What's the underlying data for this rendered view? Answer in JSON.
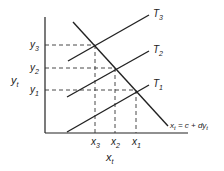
{
  "diagram": {
    "axes": {
      "y_label": "y",
      "y_label_sub": "t",
      "x_label": "x",
      "x_label_sub": "t"
    },
    "y_ticks": [
      {
        "label": "y",
        "sub": "3"
      },
      {
        "label": "y",
        "sub": "2"
      },
      {
        "label": "y",
        "sub": "1"
      }
    ],
    "x_ticks": [
      {
        "label": "x",
        "sub": "3"
      },
      {
        "label": "x",
        "sub": "2"
      },
      {
        "label": "x",
        "sub": "1"
      }
    ],
    "lines": [
      {
        "label": "T",
        "sub": "3"
      },
      {
        "label": "T",
        "sub": "2"
      },
      {
        "label": "T",
        "sub": "1"
      }
    ],
    "equation": {
      "x": "x",
      "x_sub": "t",
      "rest": " = c + dy",
      "y_sub": "t"
    },
    "colors": {
      "line": "#222222",
      "background": "#ffffff"
    }
  }
}
